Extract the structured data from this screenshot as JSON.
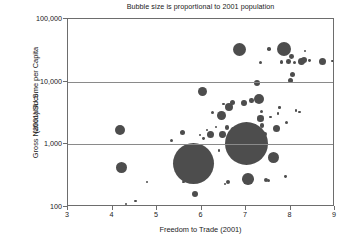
{
  "chart_data": {
    "type": "scatter",
    "title": "Bubble size is proportional to 2001 population",
    "xlabel": "Freedom to Trade (2001)",
    "ylabel_line1": "Gross National Income per Capita",
    "ylabel_line2": "(2001) $U.S.",
    "xlim": [
      3,
      9
    ],
    "ylim": [
      100,
      100000
    ],
    "yscale": "log",
    "xticks": [
      "3",
      "4",
      "5",
      "6",
      "7",
      "8",
      "9"
    ],
    "xtick_values": [
      3,
      4,
      5,
      6,
      7,
      8,
      9
    ],
    "yticks": [
      "100,000",
      "10,000",
      "1,000",
      "100"
    ],
    "ytick_values": [
      100000,
      10000,
      1000,
      100
    ],
    "grid": "horizontal-only-at-10000-and-1000",
    "legend": "none",
    "bubble_color": "#4d4d4d",
    "frame_color": "#6d6d6d",
    "size_meaning": "Bubble area proportional to 2001 population",
    "points": [
      {
        "x": 4.17,
        "y": 1700,
        "r": 5.2
      },
      {
        "x": 4.2,
        "y": 430,
        "r": 5.6
      },
      {
        "x": 4.3,
        "y": 112,
        "r": 1.0
      },
      {
        "x": 4.52,
        "y": 125,
        "r": 1.2
      },
      {
        "x": 4.78,
        "y": 250,
        "r": 1.1
      },
      {
        "x": 5.33,
        "y": 1150,
        "r": 1.5
      },
      {
        "x": 5.58,
        "y": 1550,
        "r": 2.6
      },
      {
        "x": 5.6,
        "y": 250,
        "r": 1.3
      },
      {
        "x": 5.82,
        "y": 500,
        "r": 20.5
      },
      {
        "x": 5.86,
        "y": 160,
        "r": 3.0
      },
      {
        "x": 5.97,
        "y": 1400,
        "r": 1.1
      },
      {
        "x": 6.03,
        "y": 6900,
        "r": 4.5
      },
      {
        "x": 6.05,
        "y": 1250,
        "r": 1.4
      },
      {
        "x": 6.12,
        "y": 1700,
        "r": 1.2
      },
      {
        "x": 6.2,
        "y": 1430,
        "r": 3.6
      },
      {
        "x": 6.25,
        "y": 3200,
        "r": 1.5
      },
      {
        "x": 6.32,
        "y": 1900,
        "r": 1.2
      },
      {
        "x": 6.4,
        "y": 800,
        "r": 1.2
      },
      {
        "x": 6.45,
        "y": 2900,
        "r": 4.4
      },
      {
        "x": 6.48,
        "y": 1450,
        "r": 3.4
      },
      {
        "x": 6.5,
        "y": 4400,
        "r": 1.4
      },
      {
        "x": 6.52,
        "y": 230,
        "r": 1.1
      },
      {
        "x": 6.57,
        "y": 1850,
        "r": 2.3
      },
      {
        "x": 6.6,
        "y": 250,
        "r": 2.0
      },
      {
        "x": 6.62,
        "y": 3950,
        "r": 4.0
      },
      {
        "x": 6.7,
        "y": 4700,
        "r": 2.6
      },
      {
        "x": 6.72,
        "y": 1700,
        "r": 2.4
      },
      {
        "x": 6.85,
        "y": 33000,
        "r": 6.6
      },
      {
        "x": 6.9,
        "y": 1750,
        "r": 3.1
      },
      {
        "x": 6.95,
        "y": 4600,
        "r": 2.9
      },
      {
        "x": 7.02,
        "y": 1050,
        "r": 21.5
      },
      {
        "x": 7.05,
        "y": 280,
        "r": 5.8
      },
      {
        "x": 7.12,
        "y": 5000,
        "r": 2.2
      },
      {
        "x": 7.2,
        "y": 1900,
        "r": 2.5
      },
      {
        "x": 7.25,
        "y": 9500,
        "r": 3.3
      },
      {
        "x": 7.3,
        "y": 5200,
        "r": 5.0
      },
      {
        "x": 7.32,
        "y": 20000,
        "r": 1.6
      },
      {
        "x": 7.33,
        "y": 2600,
        "r": 3.2
      },
      {
        "x": 7.35,
        "y": 3300,
        "r": 1.5
      },
      {
        "x": 7.36,
        "y": 2000,
        "r": 2.1
      },
      {
        "x": 7.4,
        "y": 1100,
        "r": 1.3
      },
      {
        "x": 7.42,
        "y": 1450,
        "r": 2.2
      },
      {
        "x": 7.45,
        "y": 270,
        "r": 2.3
      },
      {
        "x": 7.5,
        "y": 265,
        "r": 1.6
      },
      {
        "x": 7.52,
        "y": 33000,
        "r": 1.8
      },
      {
        "x": 7.55,
        "y": 2700,
        "r": 1.2
      },
      {
        "x": 7.62,
        "y": 620,
        "r": 5.6
      },
      {
        "x": 7.68,
        "y": 1800,
        "r": 3.5
      },
      {
        "x": 7.72,
        "y": 3100,
        "r": 1.2
      },
      {
        "x": 7.75,
        "y": 3900,
        "r": 1.3
      },
      {
        "x": 7.8,
        "y": 20500,
        "r": 1.9
      },
      {
        "x": 7.85,
        "y": 33000,
        "r": 7.2
      },
      {
        "x": 7.88,
        "y": 310,
        "r": 1.4
      },
      {
        "x": 7.92,
        "y": 2200,
        "r": 1.5
      },
      {
        "x": 7.95,
        "y": 21000,
        "r": 2.3
      },
      {
        "x": 8.0,
        "y": 10500,
        "r": 2.6
      },
      {
        "x": 8.02,
        "y": 25000,
        "r": 2.4
      },
      {
        "x": 8.05,
        "y": 13000,
        "r": 2.6
      },
      {
        "x": 8.08,
        "y": 20500,
        "r": 1.5
      },
      {
        "x": 8.12,
        "y": 3500,
        "r": 1.3
      },
      {
        "x": 8.2,
        "y": 3300,
        "r": 1.2
      },
      {
        "x": 8.25,
        "y": 21000,
        "r": 3.4
      },
      {
        "x": 8.3,
        "y": 22000,
        "r": 3.0
      },
      {
        "x": 8.32,
        "y": 31000,
        "r": 1.1
      },
      {
        "x": 8.42,
        "y": 21500,
        "r": 1.4
      },
      {
        "x": 8.72,
        "y": 21000,
        "r": 3.8
      },
      {
        "x": 8.95,
        "y": 21500,
        "r": 1.3
      }
    ]
  }
}
